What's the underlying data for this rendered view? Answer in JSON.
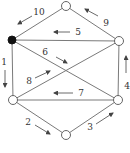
{
  "diagram": {
    "type": "directed-graph-edge-ordering",
    "colors": {
      "edge": "#7a7a7a",
      "node_stroke": "#555555",
      "node_fill": "#ffffff",
      "node_start_fill": "#111111",
      "arrow": "#444444",
      "label": "#333333"
    },
    "nodes": [
      {
        "id": "top",
        "x": 66,
        "y": 6,
        "filled": false
      },
      {
        "id": "upper-left",
        "x": 12,
        "y": 40,
        "filled": true
      },
      {
        "id": "upper-right",
        "x": 119,
        "y": 41,
        "filled": false
      },
      {
        "id": "lower-left",
        "x": 13,
        "y": 100,
        "filled": false
      },
      {
        "id": "lower-right",
        "x": 118,
        "y": 100,
        "filled": false
      },
      {
        "id": "bottom",
        "x": 66,
        "y": 135,
        "filled": false
      }
    ],
    "edges": [
      {
        "from": "upper-left",
        "to": "lower-left"
      },
      {
        "from": "lower-left",
        "to": "bottom"
      },
      {
        "from": "bottom",
        "to": "lower-right"
      },
      {
        "from": "lower-right",
        "to": "upper-right"
      },
      {
        "from": "upper-right",
        "to": "upper-left"
      },
      {
        "from": "upper-left",
        "to": "lower-right"
      },
      {
        "from": "lower-right",
        "to": "lower-left"
      },
      {
        "from": "lower-left",
        "to": "upper-right"
      },
      {
        "from": "upper-right",
        "to": "top"
      },
      {
        "from": "top",
        "to": "upper-left"
      }
    ],
    "step_labels": [
      {
        "text": "1",
        "x": 4,
        "y": 65,
        "arrow": [
          5,
          70,
          5,
          87
        ]
      },
      {
        "text": "2",
        "x": 28,
        "y": 125,
        "arrow": [
          35,
          125,
          50,
          134
        ]
      },
      {
        "text": "3",
        "x": 90,
        "y": 130,
        "arrow": [
          96,
          124,
          113,
          113
        ]
      },
      {
        "text": "4",
        "x": 127,
        "y": 89,
        "arrow": [
          126,
          73,
          126,
          56
        ]
      },
      {
        "text": "5",
        "x": 78,
        "y": 35,
        "arrow": [
          70,
          32,
          54,
          32
        ]
      },
      {
        "text": "6",
        "x": 45,
        "y": 55,
        "arrow": [
          56,
          57,
          67,
          63
        ]
      },
      {
        "text": "7",
        "x": 81,
        "y": 96,
        "arrow": [
          73,
          93,
          54,
          93
        ]
      },
      {
        "text": "8",
        "x": 29,
        "y": 84,
        "arrow": [
          35,
          78,
          50,
          71
        ]
      },
      {
        "text": "9",
        "x": 106,
        "y": 26,
        "arrow": [
          98,
          16,
          85,
          9
        ]
      },
      {
        "text": "10",
        "x": 39,
        "y": 15,
        "arrow": [
          32,
          16,
          18,
          24
        ]
      }
    ]
  }
}
